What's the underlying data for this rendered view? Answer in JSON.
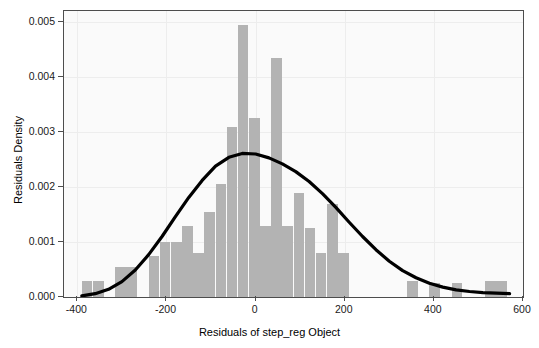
{
  "chart_data": {
    "type": "bar",
    "title": "",
    "subtitle": "",
    "xlabel": "Residuals of step_reg Object",
    "ylabel": "Residuals Density",
    "xlim": [
      -430,
      600
    ],
    "ylim": [
      0,
      0.0052
    ],
    "xticks": [
      -400,
      -200,
      0,
      200,
      400,
      600
    ],
    "xtick_labels": [
      "-400",
      "-200",
      "0",
      "200",
      "400",
      "600"
    ],
    "yticks": [
      0.0,
      0.001,
      0.002,
      0.003,
      0.004,
      0.005
    ],
    "ytick_labels": [
      "0.000",
      "0.001",
      "0.002",
      "0.003",
      "0.004",
      "0.005"
    ],
    "grid": true,
    "legend": "none",
    "bar_color": "#b3b3b3",
    "curve_color": "#000000",
    "panel_background": "#fafafa",
    "bin_width": 25,
    "histogram": {
      "bin_starts": [
        -390,
        -365,
        -315,
        -290,
        -240,
        -215,
        -190,
        -165,
        -140,
        -115,
        -90,
        -65,
        -40,
        -15,
        10,
        35,
        60,
        85,
        110,
        135,
        160,
        185,
        340,
        390,
        440,
        515,
        540
      ],
      "bin_ends": [
        -365,
        -340,
        -290,
        -265,
        -215,
        -190,
        -165,
        -140,
        -115,
        -90,
        -65,
        -40,
        -15,
        10,
        35,
        60,
        85,
        110,
        135,
        160,
        185,
        210,
        365,
        415,
        465,
        540,
        565
      ],
      "densities": [
        0.0003,
        0.0003,
        0.00055,
        0.00055,
        0.00075,
        0.001,
        0.001,
        0.0013,
        0.0008,
        0.00155,
        0.00205,
        0.0031,
        0.00495,
        0.00325,
        0.0013,
        0.00435,
        0.0013,
        0.0019,
        0.00125,
        0.0008,
        0.0017,
        0.0008,
        0.0003,
        0.00025,
        0.00025,
        0.0003,
        0.0003
      ]
    },
    "density_curve": {
      "x": [
        -390,
        -360,
        -330,
        -300,
        -270,
        -240,
        -210,
        -180,
        -150,
        -120,
        -90,
        -60,
        -30,
        0,
        30,
        60,
        90,
        120,
        150,
        180,
        210,
        240,
        270,
        300,
        330,
        360,
        390,
        420,
        450,
        480,
        510,
        540,
        570
      ],
      "y": [
        2e-05,
        6e-05,
        0.00014,
        0.00028,
        0.00049,
        0.00077,
        0.0011,
        0.00146,
        0.00181,
        0.00212,
        0.00238,
        0.00254,
        0.00261,
        0.0026,
        0.00253,
        0.00242,
        0.00228,
        0.0021,
        0.00188,
        0.00163,
        0.00136,
        0.0011,
        0.00086,
        0.00065,
        0.00048,
        0.00035,
        0.00025,
        0.00018,
        0.00013,
        0.0001,
        8e-05,
        7e-05,
        6e-05
      ]
    }
  }
}
